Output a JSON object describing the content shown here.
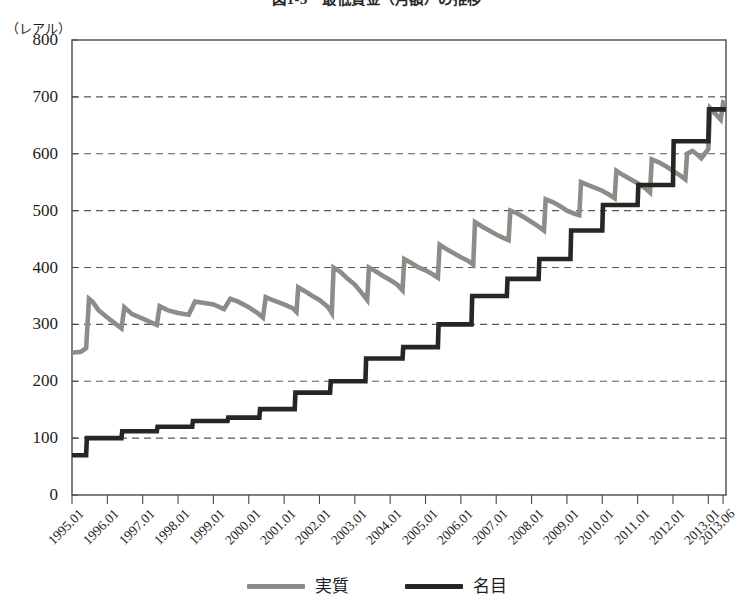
{
  "figure": {
    "title": "図1-3　最低賃金（月額）の推移",
    "unit_label": "（レアル）"
  },
  "legend": {
    "position": "bottom-center",
    "items": [
      {
        "label": "実質",
        "color": "#8d8d88",
        "series_key": "real"
      },
      {
        "label": "名目",
        "color": "#262622",
        "series_key": "nominal"
      }
    ]
  },
  "axes": {
    "y_ticks": [
      "800",
      "700",
      "600",
      "500",
      "400",
      "300",
      "200",
      "100",
      "0"
    ],
    "x_ticks": [
      "1995.01",
      "1996.01",
      "1997.01",
      "1998.01",
      "1999.01",
      "2000.01",
      "2001.01",
      "2002.01",
      "2003.01",
      "2004.01",
      "2005.01",
      "2006.01",
      "2007.01",
      "2008.01",
      "2009.01",
      "2010.01",
      "2011.01",
      "2012.01",
      "2013.01",
      "2013.06"
    ]
  },
  "chart_data": {
    "type": "line",
    "title": "図1-3　最低賃金（月額）の推移",
    "xlabel": "",
    "ylabel": "（レアル）",
    "ylim": [
      0,
      800
    ],
    "ytick_step": 100,
    "grid": "horizontal-dashed",
    "legend_position": "bottom-center",
    "categories": [
      "1995.01",
      "1996.01",
      "1997.01",
      "1998.01",
      "1999.01",
      "2000.01",
      "2001.01",
      "2002.01",
      "2003.01",
      "2004.01",
      "2005.01",
      "2006.01",
      "2007.01",
      "2008.01",
      "2009.01",
      "2010.01",
      "2011.01",
      "2012.01",
      "2013.01",
      "2013.06"
    ],
    "x_start": "1995.01",
    "x_end": "2013.06",
    "series": [
      {
        "name": "実質",
        "color": "#8d8d88",
        "shape": "sawtooth",
        "note": "Real minimum wage deflated to 2013 prices: steps up at each annual adjustment then erodes with inflation.",
        "points": [
          [
            1995.0,
            250
          ],
          [
            1995.25,
            252
          ],
          [
            1995.4,
            258
          ],
          [
            1995.48,
            345
          ],
          [
            1995.58,
            340
          ],
          [
            1995.75,
            325
          ],
          [
            1996.0,
            312
          ],
          [
            1996.25,
            300
          ],
          [
            1996.4,
            293
          ],
          [
            1996.48,
            330
          ],
          [
            1996.7,
            318
          ],
          [
            1997.0,
            310
          ],
          [
            1997.25,
            303
          ],
          [
            1997.4,
            299
          ],
          [
            1997.48,
            332
          ],
          [
            1997.7,
            325
          ],
          [
            1998.0,
            320
          ],
          [
            1998.3,
            317
          ],
          [
            1998.48,
            340
          ],
          [
            1998.7,
            338
          ],
          [
            1999.0,
            335
          ],
          [
            1999.3,
            327
          ],
          [
            1999.48,
            345
          ],
          [
            1999.7,
            340
          ],
          [
            2000.0,
            330
          ],
          [
            2000.25,
            320
          ],
          [
            2000.4,
            312
          ],
          [
            2000.48,
            348
          ],
          [
            2000.7,
            342
          ],
          [
            2001.0,
            335
          ],
          [
            2001.25,
            328
          ],
          [
            2001.35,
            322
          ],
          [
            2001.4,
            365
          ],
          [
            2001.6,
            358
          ],
          [
            2001.8,
            350
          ],
          [
            2002.0,
            343
          ],
          [
            2002.25,
            330
          ],
          [
            2002.35,
            320
          ],
          [
            2002.4,
            400
          ],
          [
            2002.6,
            392
          ],
          [
            2002.8,
            380
          ],
          [
            2003.0,
            370
          ],
          [
            2003.2,
            355
          ],
          [
            2003.35,
            343
          ],
          [
            2003.4,
            400
          ],
          [
            2003.6,
            393
          ],
          [
            2003.8,
            385
          ],
          [
            2004.0,
            378
          ],
          [
            2004.2,
            370
          ],
          [
            2004.35,
            360
          ],
          [
            2004.4,
            415
          ],
          [
            2004.6,
            408
          ],
          [
            2004.8,
            400
          ],
          [
            2005.0,
            395
          ],
          [
            2005.2,
            388
          ],
          [
            2005.35,
            382
          ],
          [
            2005.4,
            440
          ],
          [
            2005.6,
            432
          ],
          [
            2005.8,
            425
          ],
          [
            2006.0,
            418
          ],
          [
            2006.2,
            412
          ],
          [
            2006.35,
            405
          ],
          [
            2006.4,
            480
          ],
          [
            2006.6,
            472
          ],
          [
            2006.8,
            465
          ],
          [
            2007.0,
            458
          ],
          [
            2007.2,
            452
          ],
          [
            2007.35,
            448
          ],
          [
            2007.4,
            500
          ],
          [
            2007.6,
            495
          ],
          [
            2007.8,
            488
          ],
          [
            2008.0,
            480
          ],
          [
            2008.2,
            472
          ],
          [
            2008.35,
            465
          ],
          [
            2008.4,
            520
          ],
          [
            2008.6,
            515
          ],
          [
            2008.8,
            508
          ],
          [
            2009.0,
            500
          ],
          [
            2009.2,
            495
          ],
          [
            2009.35,
            492
          ],
          [
            2009.4,
            550
          ],
          [
            2009.6,
            545
          ],
          [
            2009.8,
            540
          ],
          [
            2010.0,
            535
          ],
          [
            2010.2,
            528
          ],
          [
            2010.35,
            522
          ],
          [
            2010.4,
            570
          ],
          [
            2010.6,
            562
          ],
          [
            2010.8,
            555
          ],
          [
            2011.0,
            548
          ],
          [
            2011.2,
            540
          ],
          [
            2011.35,
            532
          ],
          [
            2011.4,
            590
          ],
          [
            2011.6,
            585
          ],
          [
            2011.8,
            578
          ],
          [
            2012.0,
            570
          ],
          [
            2012.2,
            562
          ],
          [
            2012.35,
            555
          ],
          [
            2012.4,
            600
          ],
          [
            2012.55,
            605
          ],
          [
            2012.7,
            598
          ],
          [
            2012.8,
            592
          ],
          [
            2012.9,
            600
          ],
          [
            2013.0,
            608
          ],
          [
            2013.05,
            680
          ],
          [
            2013.2,
            670
          ],
          [
            2013.35,
            660
          ],
          [
            2013.42,
            690
          ],
          [
            2013.5,
            688
          ]
        ]
      },
      {
        "name": "名目",
        "color": "#262622",
        "shape": "step",
        "note": "Nominal monthly minimum wage in Brazilian reais; flat between annual adjustments.",
        "points": [
          [
            1995.0,
            70
          ],
          [
            1995.4,
            70
          ],
          [
            1995.42,
            100
          ],
          [
            1996.4,
            100
          ],
          [
            1996.42,
            112
          ],
          [
            1997.4,
            112
          ],
          [
            1997.42,
            120
          ],
          [
            1998.4,
            120
          ],
          [
            1998.42,
            130
          ],
          [
            1999.4,
            130
          ],
          [
            1999.42,
            136
          ],
          [
            2000.3,
            136
          ],
          [
            2000.32,
            151
          ],
          [
            2001.3,
            151
          ],
          [
            2001.32,
            180
          ],
          [
            2002.3,
            180
          ],
          [
            2002.32,
            200
          ],
          [
            2003.3,
            200
          ],
          [
            2003.32,
            240
          ],
          [
            2004.35,
            240
          ],
          [
            2004.37,
            260
          ],
          [
            2005.35,
            260
          ],
          [
            2005.37,
            300
          ],
          [
            2006.3,
            300
          ],
          [
            2006.32,
            350
          ],
          [
            2007.3,
            350
          ],
          [
            2007.32,
            380
          ],
          [
            2008.2,
            380
          ],
          [
            2008.22,
            415
          ],
          [
            2009.1,
            415
          ],
          [
            2009.12,
            465
          ],
          [
            2010.0,
            465
          ],
          [
            2010.02,
            510
          ],
          [
            2011.0,
            510
          ],
          [
            2011.02,
            545
          ],
          [
            2012.0,
            545
          ],
          [
            2012.02,
            622
          ],
          [
            2013.0,
            622
          ],
          [
            2013.02,
            678
          ],
          [
            2013.5,
            678
          ]
        ]
      }
    ]
  },
  "style": {
    "plot_border_color": "#4a4a46",
    "gridline_color": "#5a5a55",
    "background": "#ffffff"
  }
}
